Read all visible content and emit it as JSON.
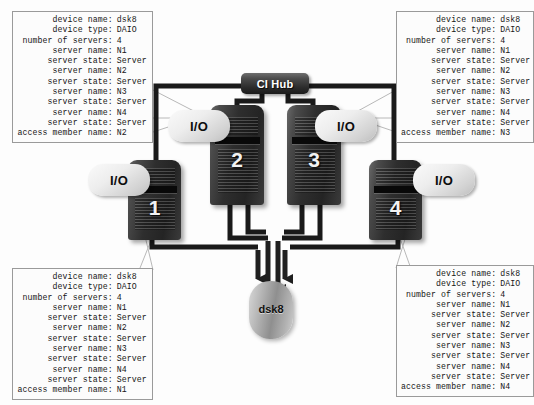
{
  "diagram": {
    "hub": {
      "label": "CI Hub",
      "name": "ci-hub"
    },
    "disk": {
      "label": "dsk8"
    },
    "colors": {
      "background": "#fdfdfd",
      "tower_body": "#2e2e2e",
      "hub_body": "#2b2b2b",
      "io_bubble": "#ededed",
      "disk_body": "#8f8f8f",
      "wire": "#1a1a1a",
      "callout_line": "#b4b4b4",
      "box_border": "#9a9a9a",
      "text": "#161616"
    },
    "servers": [
      {
        "number": "1",
        "io_label": "I/O"
      },
      {
        "number": "2",
        "io_label": "I/O"
      },
      {
        "number": "3",
        "io_label": "I/O"
      },
      {
        "number": "4",
        "io_label": "I/O"
      }
    ]
  },
  "boxes": {
    "top_left": {
      "rows": [
        {
          "label": "device name:",
          "value": "dsk8"
        },
        {
          "label": "device type:",
          "value": "DAIO"
        },
        {
          "label": "number of servers:",
          "value": "4"
        },
        {
          "label": "server name:",
          "value": "N1"
        },
        {
          "label": "server state:",
          "value": "Server"
        },
        {
          "label": "server name:",
          "value": "N2"
        },
        {
          "label": "server state:",
          "value": "Server"
        },
        {
          "label": "server name:",
          "value": "N3"
        },
        {
          "label": "server state:",
          "value": "Server"
        },
        {
          "label": "server name:",
          "value": "N4"
        },
        {
          "label": "server state:",
          "value": "Server"
        },
        {
          "label": "access member name:",
          "value": "N2"
        }
      ]
    },
    "top_right": {
      "rows": [
        {
          "label": "device name:",
          "value": "dsk8"
        },
        {
          "label": "device type:",
          "value": "DAIO"
        },
        {
          "label": "number of servers:",
          "value": "4"
        },
        {
          "label": "server name:",
          "value": "N1"
        },
        {
          "label": "server state:",
          "value": "Server"
        },
        {
          "label": "server name:",
          "value": "N2"
        },
        {
          "label": "server state:",
          "value": "Server"
        },
        {
          "label": "server name:",
          "value": "N3"
        },
        {
          "label": "server state:",
          "value": "Server"
        },
        {
          "label": "server name:",
          "value": "N4"
        },
        {
          "label": "server state:",
          "value": "Server"
        },
        {
          "label": "access member name:",
          "value": "N3"
        }
      ]
    },
    "bottom_left": {
      "rows": [
        {
          "label": "device name:",
          "value": "dsk8"
        },
        {
          "label": "device type:",
          "value": "DAIO"
        },
        {
          "label": "number of servers:",
          "value": "4"
        },
        {
          "label": "server name:",
          "value": "N1"
        },
        {
          "label": "server state:",
          "value": "Server"
        },
        {
          "label": "server name:",
          "value": "N2"
        },
        {
          "label": "server state:",
          "value": "Server"
        },
        {
          "label": "server name:",
          "value": "N3"
        },
        {
          "label": "server state:",
          "value": "Server"
        },
        {
          "label": "server name:",
          "value": "N4"
        },
        {
          "label": "server state:",
          "value": "Server"
        },
        {
          "label": "access member name:",
          "value": "N1"
        }
      ]
    },
    "bottom_right": {
      "rows": [
        {
          "label": "device name:",
          "value": "dsk8"
        },
        {
          "label": "device type:",
          "value": "DAIO"
        },
        {
          "label": "number of servers:",
          "value": "4"
        },
        {
          "label": "server name:",
          "value": "N1"
        },
        {
          "label": "server state:",
          "value": "Server"
        },
        {
          "label": "server name:",
          "value": "N2"
        },
        {
          "label": "server state:",
          "value": "Server"
        },
        {
          "label": "server name:",
          "value": "N3"
        },
        {
          "label": "server state:",
          "value": "Server"
        },
        {
          "label": "server name:",
          "value": "N4"
        },
        {
          "label": "server state:",
          "value": "Server"
        },
        {
          "label": "access member name:",
          "value": "N4"
        }
      ]
    }
  }
}
